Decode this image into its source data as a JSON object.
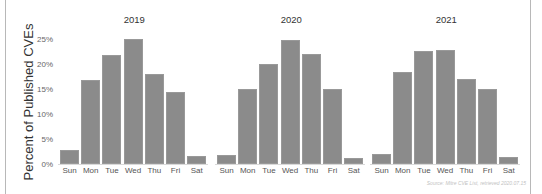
{
  "chart_data": {
    "type": "bar",
    "ylabel": "Percent of Published CVEs",
    "xlabel": "",
    "ylim": [
      0,
      25
    ],
    "yticks": [
      "0%",
      "5%",
      "10%",
      "15%",
      "20%",
      "25%"
    ],
    "grid": false,
    "categories": [
      "Sun",
      "Mon",
      "Tue",
      "Wed",
      "Thu",
      "Fri",
      "Sat"
    ],
    "panels": [
      {
        "title": "2019",
        "values": [
          2.8,
          16.8,
          21.9,
          25.0,
          18.0,
          14.5,
          1.6
        ]
      },
      {
        "title": "2020",
        "values": [
          1.9,
          15.1,
          20.1,
          24.8,
          22.0,
          15.1,
          1.3
        ]
      },
      {
        "title": "2021",
        "values": [
          2.1,
          18.4,
          22.7,
          22.9,
          17.1,
          15.1,
          1.5
        ]
      }
    ],
    "source": "Source: Mitre CVE List, retrieved 2020.07.15",
    "bar_color": "#8b8b8b"
  }
}
